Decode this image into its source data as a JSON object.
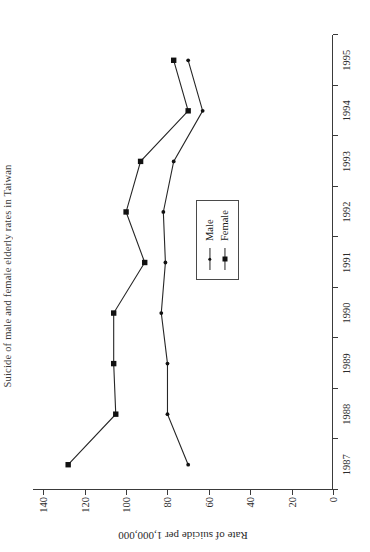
{
  "figure": {
    "title_fragment": "Suicide of male and female elderly rates in Taiwan",
    "orientation_note": "rotated-90"
  },
  "legend": {
    "position": "center-right",
    "entries": [
      {
        "label": "Male",
        "marker": "dot-marker",
        "color": "#111111"
      },
      {
        "label": "Female",
        "marker": "square-marker",
        "color": "#111111"
      }
    ]
  },
  "chart_data": {
    "type": "line",
    "title": "Suicide of male and female elderly rates in Taiwan",
    "xlabel": "",
    "ylabel": "Rate of suicide per 1,000,000",
    "x": [
      1987,
      1988,
      1989,
      1990,
      1991,
      1992,
      1993,
      1994,
      1995
    ],
    "xticklabels": [
      "1987",
      "1988",
      "1989",
      "1990",
      "1991",
      "1992",
      "1993",
      "1994",
      "1995"
    ],
    "yticks": [
      0,
      20,
      40,
      60,
      80,
      100,
      120,
      140
    ],
    "yticklabels": [
      "0",
      "20",
      "40",
      "60",
      "80",
      "100",
      "120",
      "140"
    ],
    "ylim": [
      0,
      145
    ],
    "grid": false,
    "legend_position": "center-right",
    "series": [
      {
        "name": "Female",
        "marker": "square-marker",
        "color": "#111111",
        "values": [
          128,
          105,
          106,
          106,
          91,
          100,
          93,
          70,
          77
        ]
      },
      {
        "name": "Male",
        "marker": "dot-marker",
        "color": "#111111",
        "values": [
          70,
          80,
          80,
          83,
          81,
          82,
          77,
          63,
          70
        ]
      }
    ]
  }
}
